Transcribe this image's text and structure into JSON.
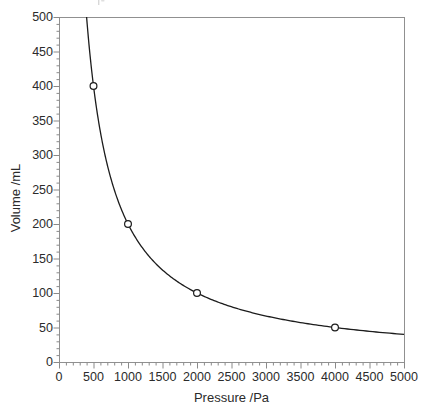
{
  "figure": {
    "cropped_caption_fragment": "partial glyph remnants of a cropped caption line above the plot"
  },
  "chart_data": {
    "type": "line",
    "title": "",
    "xlabel": "Pressure /Pa",
    "ylabel": "Volume /mL",
    "xlim": [
      0,
      5000
    ],
    "ylim": [
      0,
      500
    ],
    "grid": false,
    "legend": "none",
    "x_major_ticks": [
      0,
      500,
      1000,
      1500,
      2000,
      2500,
      3000,
      3500,
      4000,
      4500,
      5000
    ],
    "y_major_ticks": [
      0,
      50,
      100,
      150,
      200,
      250,
      300,
      350,
      400,
      450,
      500
    ],
    "x_minor_step": 100,
    "y_minor_step": 10,
    "curve": {
      "model": "inverse_proportion",
      "equation": "V = k / P",
      "constant_k": 200000,
      "p_start": 400,
      "p_end": 5000
    },
    "series": [
      {
        "name": "Boyle's law isotherm",
        "marker": "open-circle",
        "points": [
          {
            "x": 500,
            "y": 400
          },
          {
            "x": 1000,
            "y": 200
          },
          {
            "x": 2000,
            "y": 100
          },
          {
            "x": 4000,
            "y": 50
          }
        ]
      }
    ],
    "colors": {
      "curve": "#1c1c1c",
      "frame": "#909090",
      "tick": "#8a8a8a",
      "label": "#2b2b2b",
      "marker_fill": "#ffffff",
      "background": "#ffffff"
    }
  }
}
